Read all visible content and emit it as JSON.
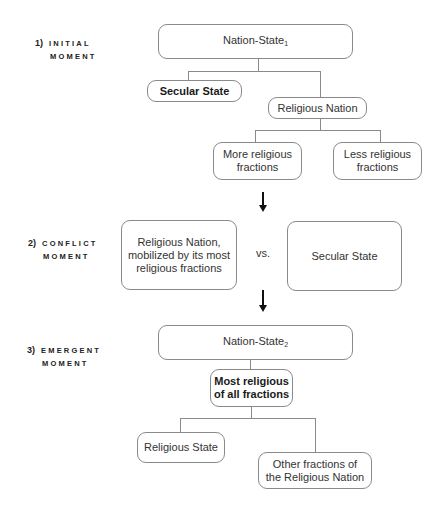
{
  "stages": [
    {
      "number": "1)",
      "line1": "INITIAL",
      "line2": "MOMENT"
    },
    {
      "number": "2)",
      "line1": "CONFLICT",
      "line2": "MOMENT"
    },
    {
      "number": "3)",
      "line1": "EMERGENT",
      "line2": "MOMENT"
    }
  ],
  "initial": {
    "root": {
      "label": "Nation-State",
      "subscript": "1"
    },
    "secular_state": "Secular State",
    "religious_nation": "Religious Nation",
    "more_religious": {
      "line1": "More religious",
      "line2": "fractions"
    },
    "less_religious": {
      "line1": "Less religious",
      "line2": "fractions"
    }
  },
  "conflict": {
    "left": {
      "line1": "Religious Nation,",
      "line2": "mobilized by its most",
      "line3": "religious fractions"
    },
    "vs": "vs.",
    "right": "Secular State"
  },
  "emergent": {
    "root": {
      "label": "Nation-State",
      "subscript": "2"
    },
    "most_religious": {
      "line1": "Most religious",
      "line2": "of all fractions"
    },
    "religious_state": "Religious State",
    "other_fractions": {
      "line1": "Other fractions of",
      "line2": "the Religious Nation"
    }
  }
}
